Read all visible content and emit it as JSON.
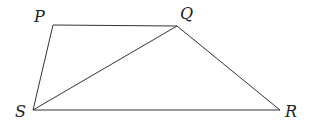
{
  "diagram": {
    "type": "geometry-figure",
    "vertices": [
      {
        "name": "P",
        "x": 53,
        "y": 25,
        "label_x": 34,
        "label_y": 22
      },
      {
        "name": "Q",
        "x": 177,
        "y": 26,
        "label_x": 180,
        "label_y": 19
      },
      {
        "name": "R",
        "x": 280,
        "y": 110,
        "label_x": 285,
        "label_y": 117
      },
      {
        "name": "S",
        "x": 33,
        "y": 110,
        "label_x": 15,
        "label_y": 117
      }
    ],
    "edges": [
      {
        "from": "P",
        "to": "Q"
      },
      {
        "from": "Q",
        "to": "R"
      },
      {
        "from": "R",
        "to": "S"
      },
      {
        "from": "S",
        "to": "P"
      },
      {
        "from": "S",
        "to": "Q"
      }
    ],
    "labels": {
      "P": "P",
      "Q": "Q",
      "R": "R",
      "S": "S"
    },
    "colors": {
      "stroke": "#333333",
      "text": "#222222",
      "background": "#ffffff"
    }
  }
}
